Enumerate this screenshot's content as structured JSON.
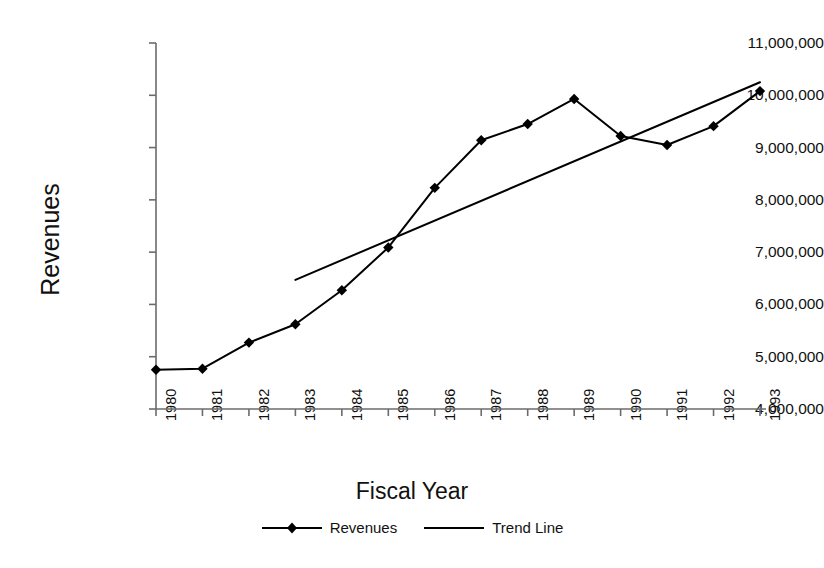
{
  "chart_data": {
    "type": "line",
    "title": "",
    "xlabel": "Fiscal Year",
    "ylabel": "Revenues",
    "x": [
      1980,
      1981,
      1982,
      1983,
      1984,
      1985,
      1986,
      1987,
      1988,
      1989,
      1990,
      1991,
      1992,
      1993
    ],
    "categories": [
      "1980",
      "1981",
      "1982",
      "1983",
      "1984",
      "1985",
      "1986",
      "1987",
      "1988",
      "1989",
      "1990",
      "1991",
      "1992",
      "1993"
    ],
    "series": [
      {
        "name": "Revenues",
        "marker": "diamond",
        "color": "#000000",
        "values": [
          4750000,
          4770000,
          5270000,
          5620000,
          6270000,
          7090000,
          8230000,
          9140000,
          9450000,
          9930000,
          9220000,
          9050000,
          9410000,
          10080000
        ]
      },
      {
        "name": "Trend Line",
        "marker": "none",
        "color": "#000000",
        "x": [
          1983,
          1993
        ],
        "values": [
          6470000,
          10250000
        ]
      }
    ],
    "ylim": [
      4000000,
      11000000
    ],
    "ytick_values": [
      4000000,
      5000000,
      6000000,
      7000000,
      8000000,
      9000000,
      10000000,
      11000000
    ],
    "ytick_labels": [
      "4,000,000",
      "5,000,000",
      "6,000,000",
      "7,000,000",
      "8,000,000",
      "9,000,000",
      "10,000,000",
      "11,000,000"
    ],
    "xlim": [
      1980,
      1993
    ],
    "grid": false,
    "legend_position": "bottom",
    "legend_entries": [
      "Revenues",
      "Trend Line"
    ]
  },
  "axes": {
    "y_title": "Revenues",
    "x_title": "Fiscal Year"
  },
  "legend": {
    "items": [
      {
        "label": "Revenues",
        "swatch": "line-with-diamond-marker"
      },
      {
        "label": "Trend Line",
        "swatch": "plain-line"
      }
    ]
  },
  "colors": {
    "line": "#000000",
    "axis": "#6b6b6b",
    "text": "#111111",
    "background": "#ffffff"
  }
}
